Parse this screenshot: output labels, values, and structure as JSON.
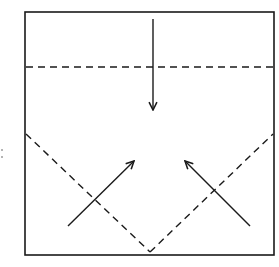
{
  "diagram": {
    "type": "origami-fold-instruction",
    "colors": {
      "line": "#1a1a1a",
      "background": "#ffffff"
    },
    "square": {
      "x": 25,
      "y": 12,
      "width": 249,
      "height": 243
    },
    "fold_lines": [
      {
        "id": "top-valley-fold",
        "style": "dashed",
        "from": [
          26,
          67
        ],
        "to": [
          273,
          67
        ]
      },
      {
        "id": "left-diagonal-fold",
        "style": "dashed",
        "from": [
          26,
          134
        ],
        "to": [
          150,
          252
        ]
      },
      {
        "id": "right-diagonal-fold",
        "style": "dashed",
        "from": [
          150,
          252
        ],
        "to": [
          273,
          134
        ]
      }
    ],
    "arrows": [
      {
        "id": "fold-down-arrow",
        "from": [
          153,
          19
        ],
        "to": [
          153,
          110
        ]
      },
      {
        "id": "fold-up-left-arrow",
        "from": [
          68,
          226
        ],
        "to": [
          134,
          161
        ]
      },
      {
        "id": "fold-up-right-arrow",
        "from": [
          250,
          226
        ],
        "to": [
          185,
          161
        ]
      }
    ]
  }
}
